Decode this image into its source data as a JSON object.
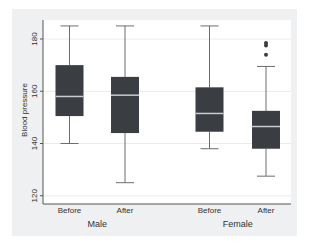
{
  "chart_data": {
    "type": "box",
    "title": "",
    "ylabel": "Blood pressure",
    "xlabel": "",
    "ylim": [
      117,
      187
    ],
    "yticks": [
      120,
      140,
      160,
      180
    ],
    "grid": true,
    "legend": null,
    "groups": [
      {
        "name": "Male",
        "boxes": [
          {
            "label": "Before",
            "whisker_low": 140,
            "q1": 150.5,
            "median": 158,
            "q3": 170,
            "whisker_high": 185,
            "outliers": []
          },
          {
            "label": "After",
            "whisker_low": 125,
            "q1": 144,
            "median": 158.5,
            "q3": 165.5,
            "whisker_high": 185,
            "outliers": []
          }
        ]
      },
      {
        "name": "Female",
        "boxes": [
          {
            "label": "Before",
            "whisker_low": 138,
            "q1": 144.5,
            "median": 151.5,
            "q3": 161.5,
            "whisker_high": 185,
            "outliers": []
          },
          {
            "label": "After",
            "whisker_low": 127.5,
            "q1": 138,
            "median": 146.5,
            "q3": 152.5,
            "whisker_high": 169.5,
            "outliers": [
              174,
              177.5,
              178.5
            ]
          }
        ]
      }
    ],
    "colors": {
      "box_fill": "#3a3d42",
      "median": "#c8ccd0",
      "whisker": "#6a6d70",
      "background": "#eef0f1",
      "plot_bg": "#ffffff",
      "grid": "#e8ecef"
    }
  }
}
